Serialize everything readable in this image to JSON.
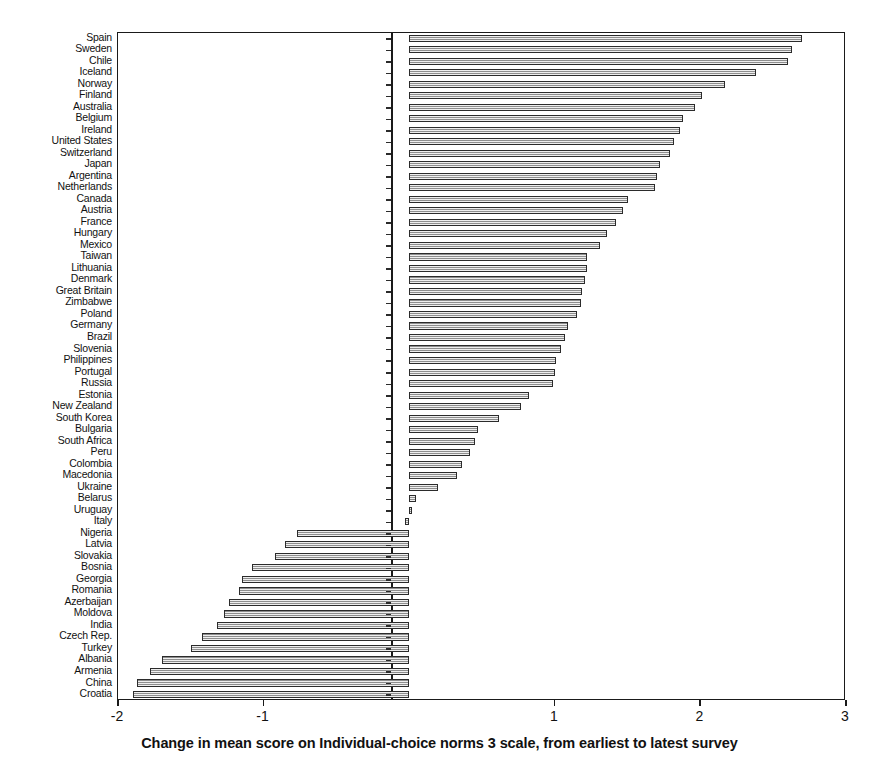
{
  "chart_data": {
    "type": "bar",
    "orientation": "horizontal",
    "title": "",
    "xlabel": "Change in mean score on Individual-choice norms 3 scale, from earliest to latest survey",
    "ylabel": "",
    "xlim": [
      -2,
      3
    ],
    "xticks": [
      -2,
      -1,
      1,
      2,
      3
    ],
    "xticklabels": [
      "-2",
      "-1",
      "1",
      "2",
      "3"
    ],
    "grid": false,
    "legend": null,
    "zero_line": 0,
    "categories": [
      "Spain",
      "Sweden",
      "Chile",
      "Iceland",
      "Norway",
      "Finland",
      "Australia",
      "Belgium",
      "Ireland",
      "United States",
      "Switzerland",
      "Japan",
      "Argentina",
      "Netherlands",
      "Canada",
      "Austria",
      "France",
      "Hungary",
      "Mexico",
      "Taiwan",
      "Lithuania",
      "Denmark",
      "Great Britain",
      "Zimbabwe",
      "Poland",
      "Germany",
      "Brazil",
      "Slovenia",
      "Philippines",
      "Portugal",
      "Russia",
      "Estonia",
      "New Zealand",
      "South Korea",
      "Bulgaria",
      "South Africa",
      "Peru",
      "Colombia",
      "Macedonia",
      "Ukraine",
      "Belarus",
      "Uruguay",
      "Italy",
      "Nigeria",
      "Latvia",
      "Slovakia",
      "Bosnia",
      "Georgia",
      "Romania",
      "Azerbaijan",
      "Moldova",
      "India",
      "Czech Rep.",
      "Turkey",
      "Albania",
      "Armenia",
      "China",
      "Croatia"
    ],
    "values": [
      2.7,
      2.63,
      2.6,
      2.38,
      2.17,
      2.01,
      1.96,
      1.88,
      1.86,
      1.82,
      1.79,
      1.72,
      1.7,
      1.69,
      1.5,
      1.47,
      1.42,
      1.36,
      1.31,
      1.22,
      1.22,
      1.21,
      1.19,
      1.18,
      1.15,
      1.09,
      1.07,
      1.04,
      1.01,
      1.0,
      0.99,
      0.82,
      0.77,
      0.62,
      0.47,
      0.45,
      0.42,
      0.36,
      0.33,
      0.2,
      0.05,
      0.02,
      -0.03,
      -0.77,
      -0.85,
      -0.92,
      -1.08,
      -1.15,
      -1.17,
      -1.24,
      -1.27,
      -1.32,
      -1.42,
      -1.5,
      -1.7,
      -1.78,
      -1.87,
      -1.9
    ]
  },
  "axis": {
    "x_title": "Change in mean score on Individual-choice norms 3 scale, from earliest to latest survey"
  }
}
